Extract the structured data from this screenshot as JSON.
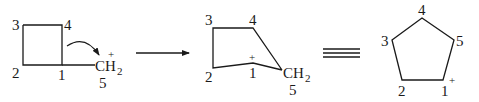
{
  "diagram": {
    "type": "reaction-mechanism",
    "reactant": {
      "name": "cyclobutylmethyl cation",
      "ring_labels": [
        "1",
        "2",
        "3",
        "4"
      ],
      "substituent": {
        "text": "CH",
        "subscript": "2",
        "charge": "+",
        "label": "5"
      },
      "curved_arrow": "bond 1-4 migrates to C5"
    },
    "reaction_arrow": "→",
    "intermediate": {
      "labels": [
        "1",
        "2",
        "3",
        "4",
        "5"
      ],
      "charge_on": "1",
      "charge": "+",
      "group": {
        "text": "CH",
        "subscript": "2"
      }
    },
    "equivalence_symbol": "≡",
    "product": {
      "name": "cyclopentyl cation",
      "labels": [
        "1",
        "2",
        "3",
        "4",
        "5"
      ],
      "charge_on": "1",
      "charge": "+"
    }
  }
}
